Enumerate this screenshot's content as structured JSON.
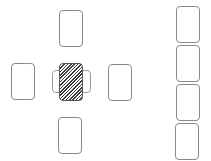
{
  "game": {
    "layout": "cross-tableau-with-side-column",
    "colors": {
      "background": "#ffffff",
      "card_border": "#8a8a8a",
      "card_back_stripe": "#3a3a3a"
    },
    "tableau": {
      "top": {
        "label": "",
        "face": "empty"
      },
      "left": {
        "label": "",
        "face": "empty"
      },
      "center": {
        "label": "",
        "face": "back"
      },
      "right": {
        "label": "",
        "face": "empty"
      },
      "bottom": {
        "label": "",
        "face": "empty"
      },
      "center_under_left": {
        "label": "",
        "face": "empty"
      },
      "center_under_right": {
        "label": "",
        "face": "empty"
      }
    },
    "side_column": [
      {
        "label": "",
        "face": "empty"
      },
      {
        "label": "",
        "face": "empty"
      },
      {
        "label": "",
        "face": "empty"
      },
      {
        "label": "",
        "face": "empty"
      }
    ]
  }
}
